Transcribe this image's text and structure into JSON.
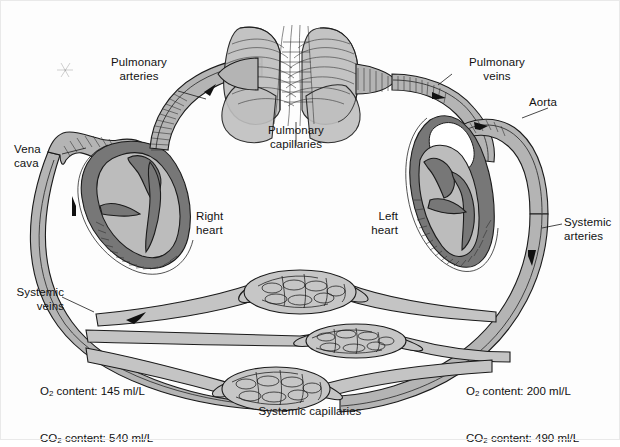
{
  "figure": {
    "caption": "Systemic capillaries"
  },
  "labels": {
    "pulmonary_arteries": "Pulmonary\narteries",
    "pulmonary_veins": "Pulmonary\nveins",
    "pulmonary_capillaries": "Pulmonary\ncapillaries",
    "aorta": "Aorta",
    "vena_cava": "Vena\ncava",
    "right_heart": "Right\nheart",
    "left_heart": "Left\nheart",
    "systemic_arteries": "Systemic\narteries",
    "systemic_veins": "Systemic\nveins",
    "systemic_capillaries": "Systemic capillaries"
  },
  "measurements": {
    "venous": {
      "o2_label": "O",
      "o2_sub": "2",
      "o2_text": " content: 145 ml/L",
      "co2_label": "CO",
      "co2_sub": "2",
      "co2_text": " content: 540 ml/L",
      "o2_value": "145 ml/L",
      "co2_value": "540 ml/L"
    },
    "arterial": {
      "o2_label": "O",
      "o2_sub": "2",
      "o2_text": " content: 200 ml/L",
      "co2_label": "CO",
      "co2_sub": "2",
      "co2_text": " content: 490 ml/L",
      "o2_value": "200 ml/L",
      "co2_value": "490 ml/L"
    }
  },
  "colors": {
    "vessel_fill": "#b4b4b4",
    "vessel_fill_light": "#c6c6c6",
    "outline": "#1b1b1b",
    "heart_wall": "#6e6e6e",
    "heart_lumen": "#b9b9b9",
    "lung_fill": "#bdbdbd",
    "background": "#fdfdfd",
    "text": "#121212"
  }
}
